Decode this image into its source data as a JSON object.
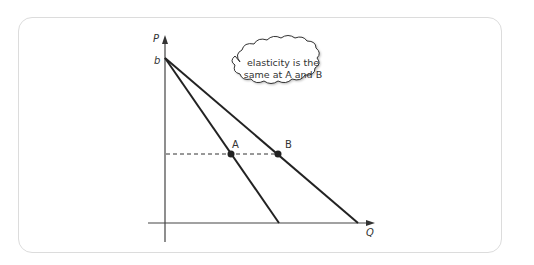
{
  "diagram": {
    "axes": {
      "y_label": "P",
      "x_label": "Q",
      "intercept_label": "b"
    },
    "curves": [
      {
        "name": "steeper-demand",
        "from": [
          165,
          59
        ],
        "to": [
          279,
          222
        ]
      },
      {
        "name": "flatter-demand",
        "from": [
          165,
          59
        ],
        "to": [
          357,
          222
        ]
      }
    ],
    "points": [
      {
        "label": "A",
        "x": 230,
        "y": 153
      },
      {
        "label": "B",
        "x": 277,
        "y": 153
      }
    ],
    "callout": {
      "line1": "elasticity is the",
      "line2": "same at A and B"
    },
    "colors": {
      "line": "#222222",
      "axis": "#444444",
      "frame": "#dcdcdc"
    }
  }
}
